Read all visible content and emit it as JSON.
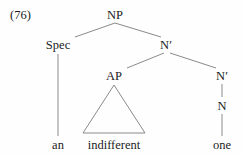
{
  "figure": {
    "example_number": "(76)",
    "background_color": "#fefefe",
    "line_color": "#8a8a8a",
    "text_color": "#1c1c1c",
    "width": 244,
    "height": 155
  },
  "tree": {
    "nodes": [
      {
        "id": "np",
        "label": "NP",
        "x": 115,
        "y": 9,
        "kind": "phrasal"
      },
      {
        "id": "spec",
        "label": "Spec",
        "x": 58,
        "y": 39,
        "kind": "phrasal"
      },
      {
        "id": "nbar1",
        "label": "N′",
        "x": 166,
        "y": 39,
        "kind": "bar"
      },
      {
        "id": "ap",
        "label": "AP",
        "x": 114,
        "y": 70,
        "kind": "phrasal"
      },
      {
        "id": "nbar2",
        "label": "N′",
        "x": 222,
        "y": 70,
        "kind": "bar"
      },
      {
        "id": "n",
        "label": "N",
        "x": 222,
        "y": 100,
        "kind": "head"
      }
    ],
    "terminals": [
      {
        "id": "an",
        "label": "an",
        "x": 58,
        "y": 139
      },
      {
        "id": "indifferent",
        "label": "indifferent",
        "x": 114,
        "y": 139
      },
      {
        "id": "one",
        "label": "one",
        "x": 222,
        "y": 139
      }
    ],
    "branches": [
      {
        "from": "np",
        "to": "spec",
        "x1": 115,
        "y1": 23,
        "x2": 75,
        "y2": 37
      },
      {
        "from": "np",
        "to": "nbar1",
        "x1": 115,
        "y1": 23,
        "x2": 161,
        "y2": 37
      },
      {
        "from": "nbar1",
        "to": "ap",
        "x1": 164,
        "y1": 53,
        "x2": 127,
        "y2": 68
      },
      {
        "from": "nbar1",
        "to": "nbar2",
        "x1": 170,
        "y1": 53,
        "x2": 216,
        "y2": 68
      },
      {
        "from": "spec",
        "to": "an",
        "x1": 58,
        "y1": 54,
        "x2": 58,
        "y2": 136
      },
      {
        "from": "nbar2",
        "to": "n",
        "x1": 222,
        "y1": 84,
        "x2": 222,
        "y2": 97
      },
      {
        "from": "n",
        "to": "one",
        "x1": 222,
        "y1": 114,
        "x2": 222,
        "y2": 136
      }
    ],
    "triangle": {
      "id": "ap-triangle",
      "apex_x": 114,
      "apex_y": 85,
      "left_x": 83,
      "left_y": 133,
      "right_x": 145,
      "right_y": 133
    }
  }
}
